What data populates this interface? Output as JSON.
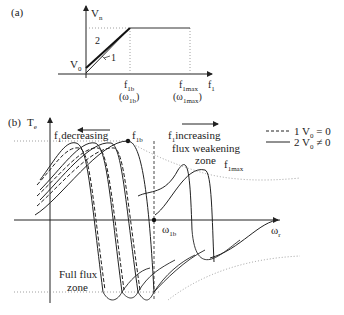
{
  "panel_a": {
    "label": "(a)",
    "y_axis": {
      "symbol": "V",
      "sub": "n"
    },
    "x_axis": {
      "symbol": "f",
      "sub": "1"
    },
    "v0": {
      "symbol": "V",
      "sub": "0"
    },
    "curve1_label": "1",
    "curve2_label": "2",
    "f1b": {
      "symbol": "f",
      "sub": "1b",
      "paren": "(ω",
      "paren_sub": "1b",
      "paren_close": ")"
    },
    "f1max": {
      "symbol": "f",
      "sub": "1max",
      "paren": "(ω",
      "paren_sub": "1max",
      "paren_close": ")"
    }
  },
  "panel_b": {
    "label": "(b)",
    "y_axis": {
      "symbol": "T",
      "sub": "e"
    },
    "x_axis": {
      "symbol": "ω",
      "sub": "r"
    },
    "f1b_label": {
      "symbol": "f",
      "sub": "1b"
    },
    "decreasing": {
      "symbol": "f",
      "sub": "1",
      "text": "decreasing"
    },
    "increasing": {
      "symbol": "f",
      "sub": "1",
      "text": "increasing"
    },
    "flux_weakening": "flux weakening",
    "zone": "zone",
    "f1max_label": {
      "symbol": "f",
      "sub": "1max"
    },
    "omega1b": {
      "symbol": "ω",
      "sub": "1b"
    },
    "full_flux_1": "Full flux",
    "full_flux_2": "zone",
    "legend": [
      {
        "style": "dashed",
        "text": "1 V",
        "sub": "0",
        "tail": " = 0"
      },
      {
        "style": "solid",
        "text": "2 V",
        "sub": "0",
        "tail": " ≠ 0"
      }
    ]
  }
}
